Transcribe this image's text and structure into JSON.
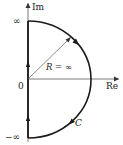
{
  "diagram": {
    "type": "nyquist-contour",
    "axes": {
      "imag_label": "Im",
      "real_label": "Re",
      "origin_label": "0"
    },
    "contour": {
      "top_label": "∞",
      "bottom_label": "−∞",
      "radius_label": "R = ∞",
      "contour_label": "C",
      "direction": "clockwise"
    },
    "colors": {
      "stroke": "#1a1a1a",
      "thin": "#555555",
      "background": "#ffffff"
    }
  }
}
